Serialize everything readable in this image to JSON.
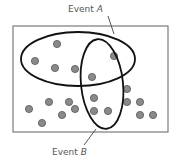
{
  "diagram": {
    "type": "venn",
    "sample_space": {
      "x": 13,
      "y": 26,
      "width": 155,
      "height": 106,
      "stroke": "#7a7a7a"
    },
    "events": [
      {
        "id": "A",
        "label_prefix": "Event ",
        "label_var": "A",
        "cx": 78,
        "cy": 59,
        "rx": 57,
        "ry": 27,
        "label_x": 68,
        "label_y": 12,
        "leader": [
          108,
          16,
          114,
          34
        ]
      },
      {
        "id": "B",
        "label_prefix": "Event ",
        "label_var": "B",
        "cx": 102,
        "cy": 84,
        "rx": 21,
        "ry": 45,
        "rotate": -6,
        "label_x": 52,
        "label_y": 155,
        "leader": [
          96,
          129,
          84,
          145
        ]
      }
    ],
    "dot_color": "#8a8a8a",
    "dot_stroke": "#555555",
    "outline_color": "#111111",
    "points": [
      {
        "x": 57,
        "y": 44
      },
      {
        "x": 35,
        "y": 61
      },
      {
        "x": 55,
        "y": 68
      },
      {
        "x": 75,
        "y": 69
      },
      {
        "x": 114,
        "y": 56
      },
      {
        "x": 92,
        "y": 77
      },
      {
        "x": 94,
        "y": 98
      },
      {
        "x": 94,
        "y": 111
      },
      {
        "x": 108,
        "y": 111
      },
      {
        "x": 127,
        "y": 89
      },
      {
        "x": 127,
        "y": 102
      },
      {
        "x": 140,
        "y": 102
      },
      {
        "x": 140,
        "y": 115
      },
      {
        "x": 153,
        "y": 115
      },
      {
        "x": 29,
        "y": 109
      },
      {
        "x": 49,
        "y": 102
      },
      {
        "x": 42,
        "y": 123
      },
      {
        "x": 69,
        "y": 102
      },
      {
        "x": 62,
        "y": 115
      },
      {
        "x": 75,
        "y": 109
      }
    ]
  }
}
